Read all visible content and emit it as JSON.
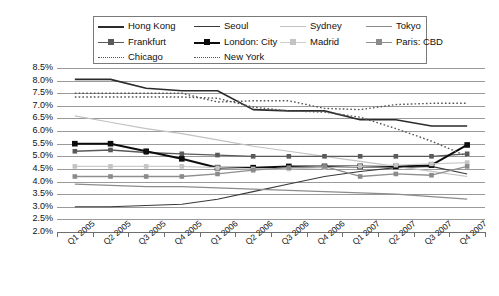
{
  "chart_data": {
    "type": "line",
    "title": "",
    "xlabel": "",
    "ylabel": "",
    "grid": true,
    "legend_position": "top",
    "ylim": [
      2.0,
      8.5
    ],
    "ytick_labels": [
      "8.5%",
      "8.0%",
      "7.5%",
      "7.0%",
      "6.5%",
      "6.0%",
      "5.5%",
      "5.0%",
      "4.5%",
      "4.0%",
      "3.5%",
      "3.0%",
      "2.5%",
      "2.0%"
    ],
    "ytick_values": [
      8.5,
      8.0,
      7.5,
      7.0,
      6.5,
      6.0,
      5.5,
      5.0,
      4.5,
      4.0,
      3.5,
      3.0,
      2.5,
      2.0
    ],
    "categories": [
      "Q1 2005",
      "Q2 2005",
      "Q3 2005",
      "Q4 2005",
      "Q1 2006",
      "Q2 2006",
      "Q3 2006",
      "Q4 2006",
      "Q1 2007",
      "Q2 2007",
      "Q3 2007",
      "Q4 2007"
    ],
    "series": [
      {
        "name": "Hong Kong",
        "color": "#2b2b2b",
        "style": "solid",
        "width": 1.6,
        "marker": "none",
        "values": [
          8.05,
          8.05,
          7.7,
          7.6,
          7.6,
          6.85,
          6.8,
          6.8,
          6.45,
          6.45,
          6.2,
          6.2
        ]
      },
      {
        "name": "Seoul",
        "color": "#3a3a3a",
        "style": "solid",
        "width": 1.1,
        "marker": "none",
        "values": [
          3.0,
          3.0,
          3.05,
          3.1,
          3.3,
          3.6,
          3.9,
          4.2,
          4.4,
          4.55,
          4.6,
          4.3
        ]
      },
      {
        "name": "Sydney",
        "color": "#c2c2c2",
        "style": "solid",
        "width": 1.2,
        "marker": "none",
        "values": [
          6.6,
          6.35,
          6.1,
          5.9,
          5.65,
          5.4,
          5.2,
          5.0,
          4.8,
          4.6,
          4.4,
          4.2
        ]
      },
      {
        "name": "Tokyo",
        "color": "#8c8c8c",
        "style": "solid",
        "width": 1.2,
        "marker": "none",
        "values": [
          3.9,
          3.85,
          3.8,
          3.8,
          3.75,
          3.7,
          3.65,
          3.6,
          3.55,
          3.5,
          3.4,
          3.3
        ]
      },
      {
        "name": "Frankfurt",
        "color": "#5a5a5a",
        "style": "solid",
        "width": 1.3,
        "marker": "square",
        "marker_color": "#5a5a5a",
        "values": [
          5.2,
          5.25,
          5.15,
          5.1,
          5.05,
          5.0,
          5.0,
          5.0,
          5.0,
          5.0,
          5.0,
          5.1
        ]
      },
      {
        "name": "London: City",
        "color": "#0d0d0d",
        "style": "solid",
        "width": 2.0,
        "marker": "square",
        "marker_color": "#0d0d0d",
        "values": [
          5.5,
          5.5,
          5.2,
          4.9,
          4.55,
          4.55,
          4.6,
          4.6,
          4.6,
          4.6,
          4.65,
          5.45
        ]
      },
      {
        "name": "Madrid",
        "color": "#cccccc",
        "style": "solid",
        "width": 1.2,
        "marker": "square",
        "marker_color": "#c4c4c4",
        "values": [
          4.6,
          4.6,
          4.6,
          4.6,
          4.55,
          4.5,
          4.5,
          4.55,
          4.6,
          4.65,
          4.7,
          4.75
        ]
      },
      {
        "name": "Paris: CBD",
        "color": "#8f8f8f",
        "style": "solid",
        "width": 1.3,
        "marker": "square",
        "marker_color": "#8a8a8a",
        "values": [
          4.2,
          4.2,
          4.2,
          4.2,
          4.3,
          4.45,
          4.55,
          4.6,
          4.2,
          4.3,
          4.25,
          4.6
        ]
      },
      {
        "name": "Chicago",
        "color": "#555555",
        "style": "dotted",
        "width": 1.4,
        "marker": "none",
        "values": [
          7.35,
          7.35,
          7.35,
          7.35,
          7.3,
          6.95,
          6.8,
          6.75,
          6.55,
          6.1,
          5.6,
          5.0
        ]
      },
      {
        "name": "New York",
        "color": "#555555",
        "style": "dotted",
        "width": 1.4,
        "marker": "none",
        "values": [
          7.5,
          7.5,
          7.5,
          7.5,
          7.15,
          7.2,
          7.2,
          6.9,
          6.85,
          7.05,
          7.1,
          7.1
        ]
      }
    ]
  },
  "legend": {
    "rows": [
      [
        {
          "label": "Hong Kong",
          "key": "hong-kong"
        },
        {
          "label": "Seoul",
          "key": "seoul"
        },
        {
          "label": "Sydney",
          "key": "sydney"
        },
        {
          "label": "Tokyo",
          "key": "tokyo"
        }
      ],
      [
        {
          "label": "Frankfurt",
          "key": "frankfurt"
        },
        {
          "label": "London: City",
          "key": "london-city"
        },
        {
          "label": "Madrid",
          "key": "madrid"
        },
        {
          "label": "Paris: CBD",
          "key": "paris-cbd"
        }
      ],
      [
        {
          "label": "Chicago",
          "key": "chicago"
        },
        {
          "label": "New York",
          "key": "new-york"
        }
      ]
    ]
  }
}
